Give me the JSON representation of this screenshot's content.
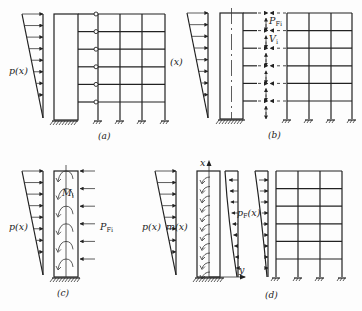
{
  "figure": {
    "panels": [
      {
        "id": "a",
        "caption": "(a)",
        "load_label": "p(x)",
        "description": "Shear wall connected to frame via pinned links at each floor"
      },
      {
        "id": "b",
        "caption": "(b)",
        "load_label": "p(x)",
        "force_label_main": "P",
        "force_label_sub": "Fi",
        "shear_label_main": "V",
        "shear_label_sub": "i",
        "description": "Wall and frame separated, interaction forces shown"
      },
      {
        "id": "c",
        "caption": "(c)",
        "load_label": "p(x)",
        "moment_label_main": "M",
        "moment_label_sub": "i",
        "force_label_main": "P",
        "force_label_sub": "Fi",
        "description": "Wall with concentrated interaction forces and moments"
      },
      {
        "id": "d",
        "caption": "(d)",
        "load_label": "p(x)",
        "moment_label": "m(x)",
        "dist_force_label_main": "p",
        "dist_force_label_sub": "F",
        "dist_force_label_tail": "(x)",
        "axis_x": "x",
        "axis_y": "y",
        "description": "Continuous model with distributed interaction"
      }
    ],
    "frame": {
      "stories": 6,
      "bays": 3
    }
  }
}
